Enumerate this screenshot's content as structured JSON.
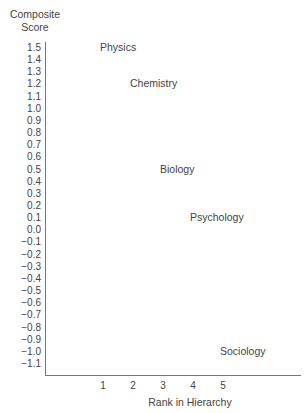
{
  "chart_data": {
    "type": "scatter",
    "title": "",
    "xlabel": "Rank in Hierarchy",
    "ylabel": "Composite Score",
    "ylabel_lines": [
      "Composite",
      "Score"
    ],
    "x_ticks": [
      "1",
      "2",
      "3",
      "4",
      "5"
    ],
    "y_ticks": [
      "1.5",
      "1.4",
      "1.3",
      "1.2",
      "1.1",
      "1.0",
      "0.9",
      "0.8",
      "0.7",
      "0.6",
      "0.5",
      "0.4",
      "0.3",
      "0.2",
      "0.1",
      "0.0",
      "−0.1",
      "−0.2",
      "−0.3",
      "−0.4",
      "−0.5",
      "−0.6",
      "−0.7",
      "−0.8",
      "−0.9",
      "−1.0",
      "−1.1"
    ],
    "ylim": [
      -1.1,
      1.5
    ],
    "xlim": [
      0,
      8
    ],
    "grid": false,
    "legend": "none",
    "points": [
      {
        "label": "Physics",
        "x": 1,
        "y": 1.5
      },
      {
        "label": "Chemistry",
        "x": 2,
        "y": 1.2
      },
      {
        "label": "Biology",
        "x": 3,
        "y": 0.5
      },
      {
        "label": "Psychology",
        "x": 4,
        "y": 0.1
      },
      {
        "label": "Sociology",
        "x": 5,
        "y": -1.0
      }
    ]
  }
}
